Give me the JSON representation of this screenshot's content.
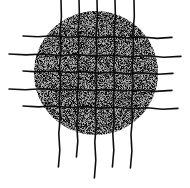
{
  "figure": {
    "width": 190,
    "height": 188,
    "background": "#ffffff",
    "disk": {
      "cx": 96,
      "cy": 73,
      "r": 62,
      "fill": "#8a8a8a",
      "texture": "stipple"
    },
    "grid": {
      "stroke": "#111111",
      "vertical_lines": [
        {
          "x1": 61,
          "y1": 0,
          "x2": 59,
          "y2": 167
        },
        {
          "x1": 79,
          "y1": 0,
          "x2": 77,
          "y2": 157
        },
        {
          "x1": 97,
          "y1": 0,
          "x2": 95,
          "y2": 178
        },
        {
          "x1": 115,
          "y1": 0,
          "x2": 113,
          "y2": 167
        },
        {
          "x1": 134,
          "y1": 0,
          "x2": 131,
          "y2": 168
        }
      ],
      "horizontal_lines": [
        {
          "x1": 23,
          "y1": 36,
          "x2": 172,
          "y2": 38
        },
        {
          "x1": 9,
          "y1": 54,
          "x2": 181,
          "y2": 57
        },
        {
          "x1": 23,
          "y1": 71,
          "x2": 173,
          "y2": 74
        },
        {
          "x1": 9,
          "y1": 89,
          "x2": 172,
          "y2": 91
        },
        {
          "x1": 23,
          "y1": 106,
          "x2": 178,
          "y2": 109
        }
      ]
    }
  }
}
